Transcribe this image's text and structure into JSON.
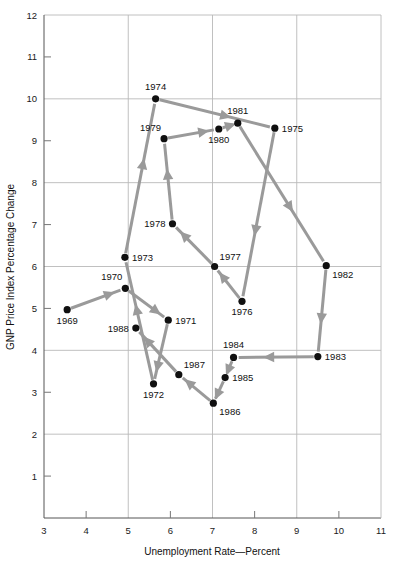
{
  "chart_data": {
    "type": "scatter",
    "title": "",
    "xlabel": "Unemployment Rate—Percent",
    "ylabel": "GNP Price Index Percentage Change",
    "xlim": [
      3,
      11
    ],
    "ylim": [
      0,
      12
    ],
    "grid": true,
    "legend": "none",
    "x_major_gridlines": [
      5,
      7,
      9
    ],
    "x_minor_ticks": [
      4,
      6,
      8,
      10
    ],
    "x_tick_labels": [
      "3",
      "4",
      "5",
      "6",
      "7",
      "8",
      "9",
      "10",
      "11"
    ],
    "y_major_gridlines": [
      2,
      4,
      6,
      8,
      10,
      12
    ],
    "y_minor_ticks": [
      1,
      3,
      5,
      7,
      9,
      11
    ],
    "y_tick_labels": [
      "1",
      "2",
      "3",
      "4",
      "5",
      "6",
      "7",
      "8",
      "9",
      "10",
      "11",
      "12"
    ],
    "series_name": "Phillips curve path 1969-1988",
    "connector": "arrow",
    "points": [
      {
        "label": "1969",
        "x": 3.55,
        "y": 4.97,
        "label_pos": "below"
      },
      {
        "label": "1970",
        "x": 4.93,
        "y": 5.48,
        "label_pos": "above-left"
      },
      {
        "label": "1971",
        "x": 5.95,
        "y": 4.72,
        "label_pos": "right"
      },
      {
        "label": "1972",
        "x": 5.6,
        "y": 3.2,
        "label_pos": "below"
      },
      {
        "label": "1973",
        "x": 4.92,
        "y": 6.22,
        "label_pos": "right"
      },
      {
        "label": "1974",
        "x": 5.65,
        "y": 10.0,
        "label_pos": "above"
      },
      {
        "label": "1975",
        "x": 8.48,
        "y": 9.3,
        "label_pos": "right"
      },
      {
        "label": "1976",
        "x": 7.7,
        "y": 5.17,
        "label_pos": "below"
      },
      {
        "label": "1977",
        "x": 7.05,
        "y": 6.0,
        "label_pos": "above-right"
      },
      {
        "label": "1978",
        "x": 6.05,
        "y": 7.02,
        "label_pos": "left"
      },
      {
        "label": "1979",
        "x": 5.85,
        "y": 9.05,
        "label_pos": "above-left"
      },
      {
        "label": "1980",
        "x": 7.15,
        "y": 9.28,
        "label_pos": "below"
      },
      {
        "label": "1981",
        "x": 7.6,
        "y": 9.42,
        "label_pos": "above"
      },
      {
        "label": "1982",
        "x": 9.7,
        "y": 6.02,
        "label_pos": "below-right"
      },
      {
        "label": "1983",
        "x": 9.5,
        "y": 3.85,
        "label_pos": "right"
      },
      {
        "label": "1984",
        "x": 7.5,
        "y": 3.83,
        "label_pos": "above"
      },
      {
        "label": "1985",
        "x": 7.3,
        "y": 3.35,
        "label_pos": "right"
      },
      {
        "label": "1986",
        "x": 7.02,
        "y": 2.74,
        "label_pos": "below-right"
      },
      {
        "label": "1987",
        "x": 6.2,
        "y": 3.42,
        "label_pos": "above-right"
      },
      {
        "label": "1988",
        "x": 5.18,
        "y": 4.53,
        "label_pos": "left"
      }
    ],
    "path_order": [
      "1969",
      "1970",
      "1971",
      "1972",
      "1973",
      "1974",
      "1975",
      "1976",
      "1977",
      "1978",
      "1979",
      "1980",
      "1981",
      "1982",
      "1983",
      "1984",
      "1985",
      "1986",
      "1987",
      "1988"
    ]
  },
  "colors": {
    "point": "#101010",
    "path": "#9a9a9a",
    "grid": "#b9b9b9",
    "axis": "#555555",
    "background": "#ffffff"
  }
}
